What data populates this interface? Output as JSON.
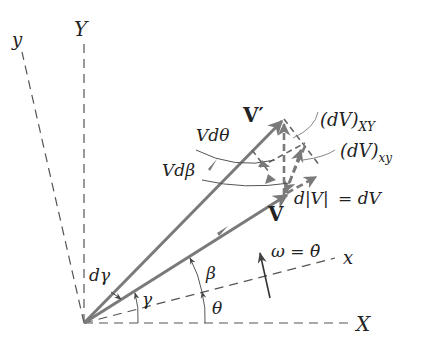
{
  "diagram": {
    "axes": {
      "X_label": "X",
      "Y_label": "Y",
      "x_label": "x",
      "y_label": "y"
    },
    "vectors": {
      "V_label": "V",
      "V_prime_label": "V′",
      "dV_XY_label": "(dV)",
      "dV_XY_sub": "XY",
      "dV_xy_label": "(dV)",
      "dV_xy_sub": "xy"
    },
    "annotations": {
      "V_dtheta": "Vdθ",
      "V_dbeta": "Vdβ",
      "dV_magnitude_lhs": "d|V|",
      "dV_magnitude_rhs": "= dV",
      "omega": "ω = θ̇",
      "d_gamma": "dγ"
    },
    "angles": {
      "gamma": "γ",
      "beta": "β",
      "theta": "θ"
    },
    "colors": {
      "vector": "#7a7a7a",
      "axis": "#555555",
      "text": "#222222"
    }
  }
}
